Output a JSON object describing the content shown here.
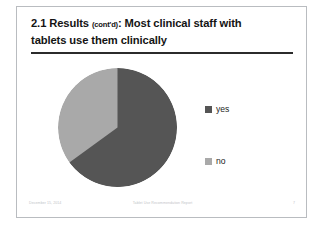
{
  "slide": {
    "title_main_pre": "2.1 Results ",
    "title_paren": "(cont'd)",
    "title_main_post": ": Most clinical staff with",
    "title_line2": "tablets use them clinically"
  },
  "footer": {
    "date": "December 15, 2014",
    "document_title": "Tablet Use Recommendation Report",
    "page_number": "7"
  },
  "legend": {
    "items": [
      {
        "label": "yes",
        "color": "#555555"
      },
      {
        "label": "no",
        "color": "#a9a9a9"
      }
    ]
  },
  "chart_data": {
    "type": "pie",
    "title": "2.1 Results (cont'd): Most clinical staff with tablets use them clinically",
    "categories": [
      "yes",
      "no"
    ],
    "values": [
      65,
      35
    ],
    "colors": [
      "#555555",
      "#a9a9a9"
    ],
    "start_angle_deg": 0,
    "direction": "clockwise",
    "legend_position": "right",
    "data_labels": false,
    "grid": false,
    "xlabel": "",
    "ylabel": ""
  }
}
